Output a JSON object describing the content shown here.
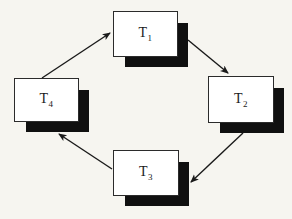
{
  "diagram": {
    "type": "cycle-graph",
    "nodes": [
      {
        "id": "t1",
        "label_base": "T",
        "label_sub": "1"
      },
      {
        "id": "t2",
        "label_base": "T",
        "label_sub": "2"
      },
      {
        "id": "t3",
        "label_base": "T",
        "label_sub": "3"
      },
      {
        "id": "t4",
        "label_base": "T",
        "label_sub": "4"
      }
    ],
    "edges": [
      {
        "from": "T1",
        "to": "T2"
      },
      {
        "from": "T2",
        "to": "T3"
      },
      {
        "from": "T3",
        "to": "T4"
      },
      {
        "from": "T4",
        "to": "T1"
      }
    ],
    "colors": {
      "background": "#f6f5f0",
      "box_fill": "#ffffff",
      "box_border": "#2b2b2b",
      "shadow": "#101010",
      "arrow": "#1a1a1a"
    }
  }
}
